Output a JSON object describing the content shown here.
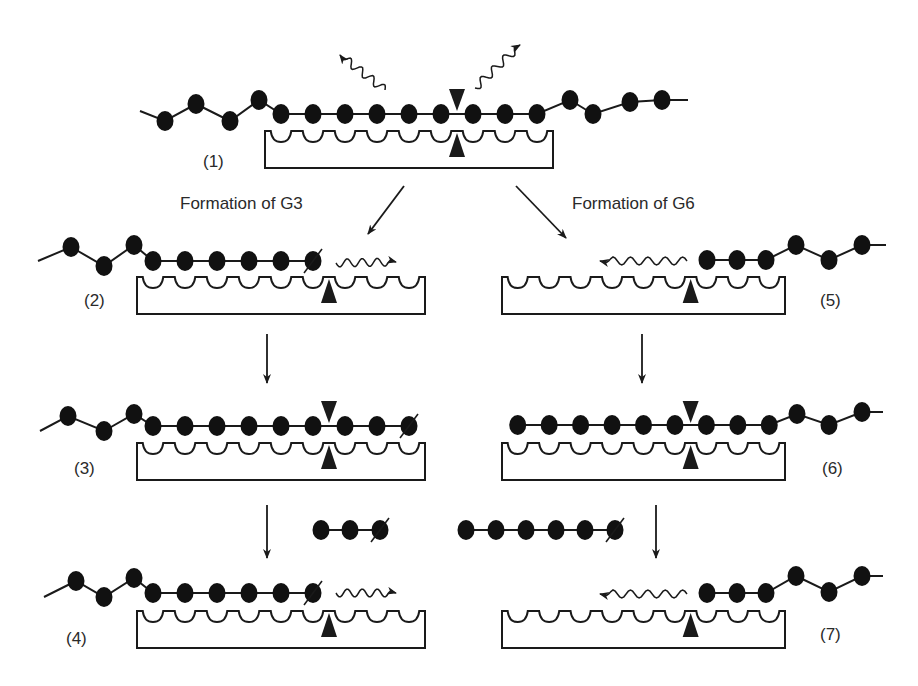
{
  "diagram": {
    "type": "enzyme-substrate binding mechanism",
    "captions": {
      "left": "Formation of G3",
      "right": "Formation of G6"
    },
    "colors": {
      "ink": "#1a1a1a",
      "bead": "#111111",
      "background": "#ffffff"
    },
    "enzyme": {
      "subsites": 9,
      "cleavage_after_subsite": 6
    },
    "panels": [
      {
        "id": "1",
        "label": "(1)",
        "description": "Substrate chain bound across all subsites; water molecules released; cleavage site marked"
      },
      {
        "id": "2",
        "label": "(2)",
        "description": "Chain shifted; water approaches cleavage site from right"
      },
      {
        "id": "3",
        "label": "(3)",
        "description": "Chain bound, cleavage site marked"
      },
      {
        "id": "4",
        "label": "(4)",
        "description": "After G3 release; water moves right"
      },
      {
        "id": "5",
        "label": "(5)",
        "description": "Chain shifted right; water moves left"
      },
      {
        "id": "6",
        "label": "(6)",
        "description": "Chain bound, cleavage site marked"
      },
      {
        "id": "7",
        "label": "(7)",
        "description": "After G6 release; water moves left"
      }
    ],
    "products": [
      {
        "name": "G3",
        "residues": 3
      },
      {
        "name": "G6",
        "residues": 6
      }
    ]
  }
}
